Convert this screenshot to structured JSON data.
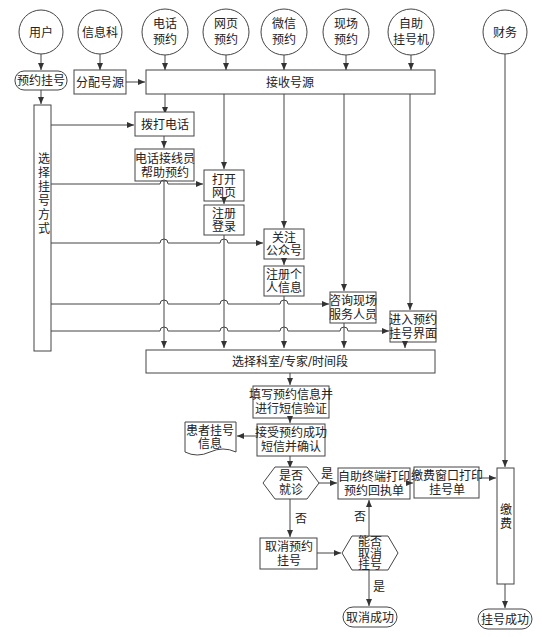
{
  "diagram": {
    "type": "flowchart",
    "actors": [
      {
        "id": "user",
        "label": [
          "用户"
        ]
      },
      {
        "id": "info_dept",
        "label": [
          "信息科"
        ]
      },
      {
        "id": "phone",
        "label": [
          "电话",
          "预约"
        ]
      },
      {
        "id": "web",
        "label": [
          "网页",
          "预约"
        ]
      },
      {
        "id": "wechat",
        "label": [
          "微信",
          "预约"
        ]
      },
      {
        "id": "onsite",
        "label": [
          "现场",
          "预约"
        ]
      },
      {
        "id": "kiosk",
        "label": [
          "自助",
          "挂号机"
        ]
      },
      {
        "id": "finance",
        "label": [
          "财务"
        ]
      }
    ],
    "nodes": {
      "book_register": [
        "预约挂号"
      ],
      "allocate_source": [
        "分配号源"
      ],
      "receive_source": [
        "接收号源"
      ],
      "choose_method": [
        "选择挂号方式"
      ],
      "dial_phone": [
        "拨打电话"
      ],
      "operator_help": [
        "电话接线员",
        "帮助预约"
      ],
      "open_web": [
        "打开",
        "网页"
      ],
      "register_login": [
        "注册",
        "登录"
      ],
      "follow_account": [
        "关注",
        "公众号"
      ],
      "register_info": [
        "注册个",
        "人信息"
      ],
      "ask_staff": [
        "咨询现场",
        "服务人员"
      ],
      "enter_interface": [
        "进入预约",
        "挂号界面"
      ],
      "select_dept": [
        "选择科室/专家/时间段"
      ],
      "fill_info": [
        "填写预约信息并",
        "进行短信验证"
      ],
      "receive_sms": [
        "接受预约成功",
        "短信并确认"
      ],
      "patient_info": [
        "患者挂号",
        "信息"
      ],
      "visit_decision": [
        "是否",
        "就诊"
      ],
      "kiosk_print": [
        "自助终端打印",
        "预约回执单"
      ],
      "window_print": [
        "缴费窗口打印",
        "挂号单"
      ],
      "pay": [
        "缴",
        "费"
      ],
      "cancel_booking": [
        "取消预约",
        "挂号"
      ],
      "can_cancel": [
        "能否",
        "取消",
        "挂号"
      ],
      "cancel_success": [
        "取消成功"
      ],
      "register_success": [
        "挂号成功"
      ]
    },
    "edge_labels": {
      "yes": "是",
      "no": "否"
    }
  }
}
